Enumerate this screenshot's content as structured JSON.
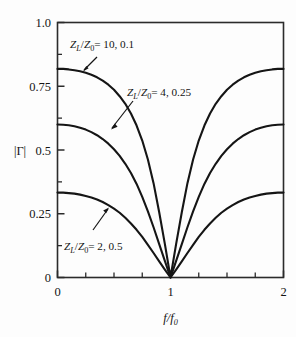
{
  "figure": {
    "background_color": "#fdfdfd",
    "line_color": "#151515"
  },
  "axes": {
    "xlabel": "f/f0",
    "xlabel_parts": {
      "num": "f",
      "den": "f",
      "den_sub": "0"
    },
    "ylabel": "|Γ|",
    "x_ticks": [
      "0",
      "1",
      "2"
    ],
    "x_tick_values": [
      0,
      1,
      2
    ],
    "x_minor_values": [
      0.25,
      0.5,
      0.75,
      1.25,
      1.5,
      1.75
    ],
    "y_ticks": [
      "1.0",
      "0.75",
      "0.5",
      "0.25",
      "0"
    ],
    "y_tick_values": [
      1.0,
      0.75,
      0.5,
      0.25,
      0
    ],
    "y_minor_values": [
      0.125,
      0.375,
      0.625,
      0.875
    ],
    "xlim": [
      0,
      2
    ],
    "ylim": [
      0,
      1
    ],
    "grid": false
  },
  "annotations": [
    {
      "id": "curve-label-10",
      "text": "ZL/Z0 = 10, 0.1",
      "lhs_num": "Z",
      "lhs_num_sub": "L",
      "lhs_den": "Z",
      "lhs_den_sub": "0",
      "rhs": "= 10, 0.1"
    },
    {
      "id": "curve-label-4",
      "text": "ZL/Z0 = 4, 0.25",
      "lhs_num": "Z",
      "lhs_num_sub": "L",
      "lhs_den": "Z",
      "lhs_den_sub": "0",
      "rhs": "= 4, 0.25"
    },
    {
      "id": "curve-label-2",
      "text": "ZL/Z0 = 2, 0.5",
      "lhs_num": "Z",
      "lhs_num_sub": "L",
      "lhs_den": "Z",
      "lhs_den_sub": "0",
      "rhs": "= 2, 0.5"
    }
  ],
  "chart_data": {
    "type": "line",
    "title": "",
    "xlabel": "f/f0",
    "ylabel": "|Γ|",
    "xlim": [
      0,
      2
    ],
    "ylim": [
      0,
      1
    ],
    "grid": false,
    "legend": "inline-annotations",
    "x": [
      0,
      0.05,
      0.1,
      0.15,
      0.2,
      0.25,
      0.3,
      0.35,
      0.4,
      0.45,
      0.5,
      0.55,
      0.6,
      0.65,
      0.7,
      0.75,
      0.8,
      0.85,
      0.9,
      0.95,
      1.0,
      1.05,
      1.1,
      1.15,
      1.2,
      1.25,
      1.3,
      1.35,
      1.4,
      1.45,
      1.5,
      1.55,
      1.6,
      1.65,
      1.7,
      1.75,
      1.8,
      1.85,
      1.9,
      1.95,
      2.0
    ],
    "series": [
      {
        "name": "ZL/Z0 = 10, 0.1",
        "peak": 0.818,
        "values": [
          0.818,
          0.818,
          0.816,
          0.813,
          0.809,
          0.803,
          0.795,
          0.785,
          0.772,
          0.756,
          0.736,
          0.711,
          0.681,
          0.643,
          0.596,
          0.537,
          0.463,
          0.37,
          0.256,
          0.132,
          0.0,
          0.132,
          0.256,
          0.37,
          0.463,
          0.537,
          0.596,
          0.643,
          0.681,
          0.711,
          0.736,
          0.756,
          0.772,
          0.785,
          0.795,
          0.803,
          0.809,
          0.813,
          0.816,
          0.818,
          0.818
        ]
      },
      {
        "name": "ZL/Z0 = 4, 0.25",
        "peak": 0.6,
        "values": [
          0.6,
          0.599,
          0.597,
          0.593,
          0.587,
          0.58,
          0.57,
          0.558,
          0.543,
          0.525,
          0.503,
          0.477,
          0.446,
          0.41,
          0.367,
          0.316,
          0.259,
          0.197,
          0.131,
          0.065,
          0.0,
          0.065,
          0.131,
          0.197,
          0.259,
          0.316,
          0.367,
          0.41,
          0.446,
          0.477,
          0.503,
          0.525,
          0.543,
          0.558,
          0.57,
          0.58,
          0.587,
          0.593,
          0.597,
          0.599,
          0.6
        ]
      },
      {
        "name": "ZL/Z0 = 2, 0.5",
        "peak": 0.333,
        "values": [
          0.333,
          0.333,
          0.331,
          0.329,
          0.325,
          0.32,
          0.314,
          0.306,
          0.296,
          0.284,
          0.27,
          0.254,
          0.234,
          0.212,
          0.187,
          0.159,
          0.128,
          0.096,
          0.063,
          0.031,
          0.0,
          0.031,
          0.063,
          0.096,
          0.128,
          0.159,
          0.187,
          0.212,
          0.234,
          0.254,
          0.27,
          0.284,
          0.296,
          0.306,
          0.314,
          0.32,
          0.325,
          0.329,
          0.331,
          0.333,
          0.333
        ]
      }
    ]
  }
}
